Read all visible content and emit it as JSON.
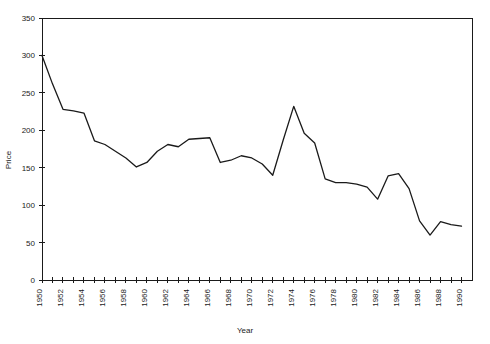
{
  "chart_data": {
    "type": "line",
    "title": "",
    "xlabel": "Year",
    "ylabel": "Price",
    "xlim": [
      1950,
      1991
    ],
    "ylim": [
      0,
      350
    ],
    "grid": false,
    "legend": null,
    "y_ticks": [
      0,
      50,
      100,
      150,
      200,
      250,
      300,
      350
    ],
    "y_tick_labels": [
      "0",
      "50",
      "100",
      "150",
      "200",
      "250",
      "300",
      "350"
    ],
    "x_ticks": [
      1950,
      1951,
      1952,
      1953,
      1954,
      1955,
      1956,
      1957,
      1958,
      1959,
      1960,
      1961,
      1962,
      1963,
      1964,
      1965,
      1966,
      1967,
      1968,
      1969,
      1970,
      1971,
      1972,
      1973,
      1974,
      1975,
      1976,
      1977,
      1978,
      1979,
      1980,
      1981,
      1982,
      1983,
      1984,
      1985,
      1986,
      1987,
      1988,
      1989,
      1990
    ],
    "x_tick_labels": [
      "1950",
      "1952",
      "1954",
      "1956",
      "1958",
      "1960",
      "1962",
      "1964",
      "1966",
      "1968",
      "1970",
      "1972",
      "1974",
      "1976",
      "1978",
      "1980",
      "1982",
      "1984",
      "1986",
      "1988",
      "1990"
    ],
    "x_tick_label_years": [
      1950,
      1952,
      1954,
      1956,
      1958,
      1960,
      1962,
      1964,
      1966,
      1968,
      1970,
      1972,
      1974,
      1976,
      1978,
      1980,
      1982,
      1984,
      1986,
      1988,
      1990
    ],
    "x_tick_label_rotation": -90,
    "line_color": "#1a1a1a",
    "x": [
      1950,
      1951,
      1952,
      1953,
      1954,
      1955,
      1956,
      1957,
      1958,
      1959,
      1960,
      1961,
      1962,
      1963,
      1964,
      1965,
      1966,
      1967,
      1968,
      1969,
      1970,
      1971,
      1972,
      1973,
      1974,
      1975,
      1976,
      1977,
      1978,
      1979,
      1980,
      1981,
      1982,
      1983,
      1984,
      1985,
      1986,
      1987,
      1988,
      1989,
      1990
    ],
    "values": [
      300,
      262,
      228,
      226,
      223,
      186,
      181,
      172,
      163,
      151,
      157,
      172,
      181,
      178,
      188,
      189,
      190,
      157,
      160,
      166,
      163,
      155,
      140,
      187,
      232,
      196,
      183,
      135,
      130,
      130,
      128,
      124,
      108,
      139,
      142,
      122,
      79,
      60,
      78,
      74,
      72
    ],
    "series": [
      {
        "name": "Price",
        "values": [
          300,
          262,
          228,
          226,
          223,
          186,
          181,
          172,
          163,
          151,
          157,
          172,
          181,
          178,
          188,
          189,
          190,
          157,
          160,
          166,
          163,
          155,
          140,
          187,
          232,
          196,
          183,
          135,
          130,
          130,
          128,
          124,
          108,
          139,
          142,
          122,
          79,
          60,
          78,
          74,
          72
        ]
      }
    ]
  }
}
